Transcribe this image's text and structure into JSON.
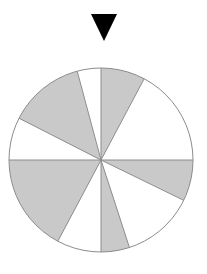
{
  "figure": {
    "name": "spinner-wheel",
    "type": "probability-spinner",
    "background_color": "#ffffff"
  },
  "pointer": {
    "icon": "triangle-down-icon",
    "color": "#000000",
    "apex_x": 104,
    "apex_y": 41,
    "left_x": 91,
    "right_x": 117,
    "top_y": 14
  },
  "wheel": {
    "center_x": 101,
    "center_y": 160,
    "radius": 92,
    "outline_color": "#8c8c8c",
    "outline_width": 1,
    "fill_gray": "#c9c9c9",
    "fill_white": "#ffffff",
    "sector_count": 8,
    "gray_count": 4,
    "white_count": 4,
    "sectors": [
      {
        "label": "sector-1",
        "fill": "#c9c9c9",
        "start_deg": 90,
        "end_deg": 62
      },
      {
        "label": "sector-2",
        "fill": "#ffffff",
        "start_deg": 62,
        "end_deg": 0
      },
      {
        "label": "sector-3",
        "fill": "#c9c9c9",
        "start_deg": 0,
        "end_deg": -26
      },
      {
        "label": "sector-4",
        "fill": "#ffffff",
        "start_deg": -26,
        "end_deg": -72
      },
      {
        "label": "sector-5",
        "fill": "#c9c9c9",
        "start_deg": -72,
        "end_deg": -90
      },
      {
        "label": "sector-6",
        "fill": "#ffffff",
        "start_deg": -90,
        "end_deg": -118
      },
      {
        "label": "sector-7",
        "fill": "#c9c9c9",
        "start_deg": -118,
        "end_deg": -180
      },
      {
        "label": "sector-8",
        "fill": "#ffffff",
        "start_deg": 180,
        "end_deg": 153
      },
      {
        "label": "sector-9",
        "fill": "#c9c9c9",
        "start_deg": 153,
        "end_deg": 105
      },
      {
        "label": "sector-10",
        "fill": "#ffffff",
        "start_deg": 105,
        "end_deg": 90
      }
    ],
    "spokes": [
      {
        "label": "spoke-top-vertical",
        "deg": 90
      },
      {
        "label": "spoke-right-horizontal",
        "deg": 0
      },
      {
        "label": "spoke-left-horizontal",
        "deg": 180
      },
      {
        "label": "spoke-bottom-vertical",
        "deg": -90
      },
      {
        "label": "spoke-upper-right",
        "deg": 62
      },
      {
        "label": "spoke-lower-right",
        "deg": -26
      },
      {
        "label": "spoke-lower-right-2",
        "deg": -72
      },
      {
        "label": "spoke-lower-left",
        "deg": -118
      },
      {
        "label": "spoke-upper-left",
        "deg": 153
      },
      {
        "label": "spoke-upper-left-2",
        "deg": 105
      }
    ]
  }
}
